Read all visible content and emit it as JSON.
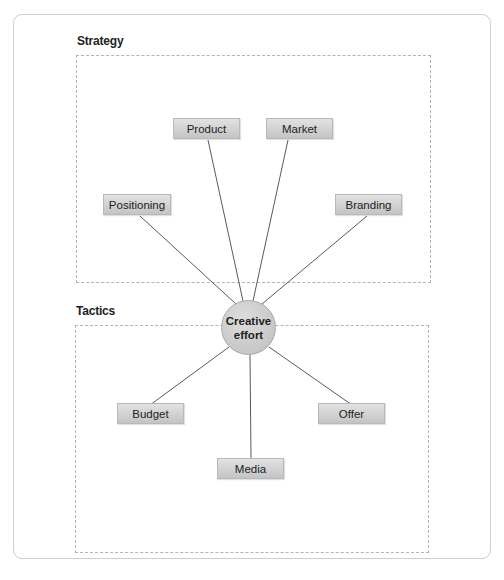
{
  "diagram": {
    "sections": [
      {
        "title": "Strategy"
      },
      {
        "title": "Tactics"
      }
    ],
    "hub": {
      "line1": "Creative",
      "line2": "effort"
    },
    "strategy_nodes": [
      {
        "label": "Positioning"
      },
      {
        "label": "Product"
      },
      {
        "label": "Market"
      },
      {
        "label": "Branding"
      }
    ],
    "tactics_nodes": [
      {
        "label": "Budget"
      },
      {
        "label": "Media"
      },
      {
        "label": "Offer"
      }
    ],
    "colors": {
      "node_fill": "#d3d3d3",
      "line": "#5a5a5a",
      "dashed_border": "#b4b4b4"
    }
  }
}
